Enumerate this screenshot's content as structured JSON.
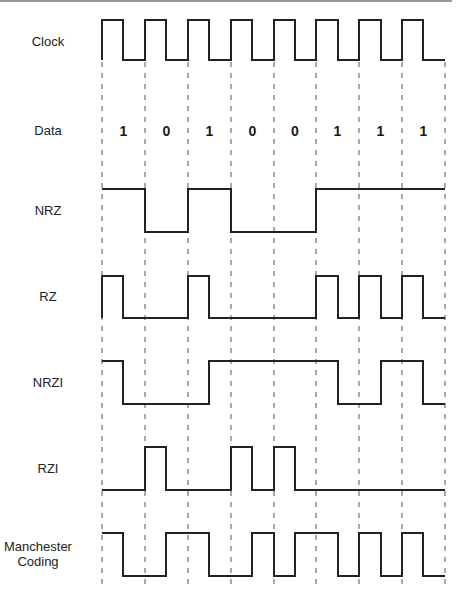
{
  "diagram": {
    "bits": [
      "1",
      "0",
      "1",
      "0",
      "0",
      "1",
      "1",
      "1"
    ],
    "rows": [
      {
        "id": "clock",
        "label": "Clock"
      },
      {
        "id": "data",
        "label": "Data"
      },
      {
        "id": "nrz",
        "label": "NRZ"
      },
      {
        "id": "rz",
        "label": "RZ"
      },
      {
        "id": "nrzi",
        "label": "NRZI"
      },
      {
        "id": "rzi",
        "label": "RZI"
      },
      {
        "id": "manchester",
        "label": "Manchester Coding",
        "label_line1": "Manchester",
        "label_line2": "Coding"
      }
    ],
    "colors": {
      "signal": "#222222",
      "grid": "#555555",
      "text": "#222222",
      "background": "#ffffff"
    }
  }
}
